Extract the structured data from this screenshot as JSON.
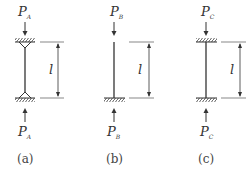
{
  "figure": {
    "columns": [
      {
        "id": "a",
        "load_symbol": "P",
        "load_subscript": "A",
        "length_label": "l",
        "caption": "(a)",
        "top_support": "pinned",
        "bottom_support": "pinned"
      },
      {
        "id": "b",
        "load_symbol": "P",
        "load_subscript": "B",
        "length_label": "l",
        "caption": "(b)",
        "top_support": "free",
        "bottom_support": "fixed"
      },
      {
        "id": "c",
        "load_symbol": "P",
        "load_subscript": "C",
        "length_label": "l",
        "caption": "(c)",
        "top_support": "fixed",
        "bottom_support": "fixed"
      }
    ]
  }
}
